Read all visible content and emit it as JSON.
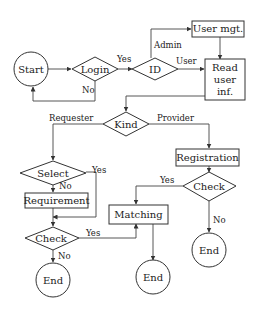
{
  "diagram": {
    "type": "flowchart",
    "nodes": {
      "start": {
        "label": "Start",
        "shape": "circle"
      },
      "login": {
        "label": "Login",
        "shape": "diamond"
      },
      "id": {
        "label": "ID",
        "shape": "diamond"
      },
      "user_mgt": {
        "label": "User mgt.",
        "shape": "rect"
      },
      "read_user_inf": {
        "label_lines": [
          "Read",
          "user",
          "inf."
        ],
        "shape": "rect"
      },
      "kind": {
        "label": "Kind",
        "shape": "diamond"
      },
      "select": {
        "label": "Select",
        "shape": "diamond"
      },
      "requirement": {
        "label": "Requirement",
        "shape": "rect"
      },
      "check_left": {
        "label": "Check",
        "shape": "diamond"
      },
      "end_left": {
        "label": "End",
        "shape": "circle"
      },
      "registration": {
        "label": "Registration",
        "shape": "rect"
      },
      "check_right": {
        "label": "Check",
        "shape": "diamond"
      },
      "end_right": {
        "label": "End",
        "shape": "circle"
      },
      "matching": {
        "label": "Matching",
        "shape": "rect"
      },
      "end_middle": {
        "label": "End",
        "shape": "circle"
      }
    },
    "edge_labels": {
      "login_yes": "Yes",
      "login_no": "No",
      "id_admin": "Admin",
      "id_user": "User",
      "kind_requester": "Requester",
      "kind_provider": "Provider",
      "select_yes": "Yes",
      "select_no": "No",
      "check_left_yes": "Yes",
      "check_left_no": "No",
      "check_right_yes": "Yes",
      "check_right_no": "No"
    },
    "edges": [
      {
        "from": "start",
        "to": "login"
      },
      {
        "from": "login",
        "to": "id",
        "label": "Yes"
      },
      {
        "from": "login",
        "to": "start",
        "label": "No"
      },
      {
        "from": "id",
        "to": "user_mgt",
        "label": "Admin"
      },
      {
        "from": "id",
        "to": "read_user_inf",
        "label": "User"
      },
      {
        "from": "user_mgt",
        "to": "read_user_inf"
      },
      {
        "from": "read_user_inf",
        "to": "kind"
      },
      {
        "from": "kind",
        "to": "select",
        "label": "Requester"
      },
      {
        "from": "kind",
        "to": "registration",
        "label": "Provider"
      },
      {
        "from": "select",
        "to": "requirement",
        "label": "No"
      },
      {
        "from": "select",
        "to": "check_left",
        "label": "Yes"
      },
      {
        "from": "requirement",
        "to": "check_left"
      },
      {
        "from": "check_left",
        "to": "matching",
        "label": "Yes"
      },
      {
        "from": "check_left",
        "to": "end_left",
        "label": "No"
      },
      {
        "from": "registration",
        "to": "check_right"
      },
      {
        "from": "check_right",
        "to": "matching",
        "label": "Yes"
      },
      {
        "from": "check_right",
        "to": "end_right",
        "label": "No"
      },
      {
        "from": "matching",
        "to": "end_middle"
      }
    ]
  }
}
